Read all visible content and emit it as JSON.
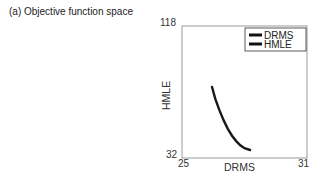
{
  "caption": "(a)  Objective function space",
  "chart_data": {
    "type": "line",
    "title": "Objective function space",
    "panel_label": "(a)",
    "xlabel": "DRMS",
    "ylabel": "HMLE",
    "xlim": [
      25,
      31
    ],
    "ylim": [
      32,
      118
    ],
    "x_ticks": [
      "25",
      "31"
    ],
    "y_ticks": [
      "32",
      "118"
    ],
    "grid": false,
    "legend_position": "upper right",
    "legend": [
      "DRMS",
      "HMLE"
    ],
    "series": [
      {
        "name": "Pareto front",
        "x": [
          26.44,
          26.6,
          26.8,
          27.0,
          27.2,
          27.4,
          27.6,
          27.8,
          28.0,
          28.27
        ],
        "y": [
          78.3,
          70.5,
          63.0,
          56.5,
          51.0,
          46.5,
          43.0,
          40.3,
          38.4,
          37.2
        ]
      }
    ]
  },
  "colors": {
    "curve": "#1a1a1a",
    "axes": "#888888",
    "legend_line": "#111111"
  }
}
